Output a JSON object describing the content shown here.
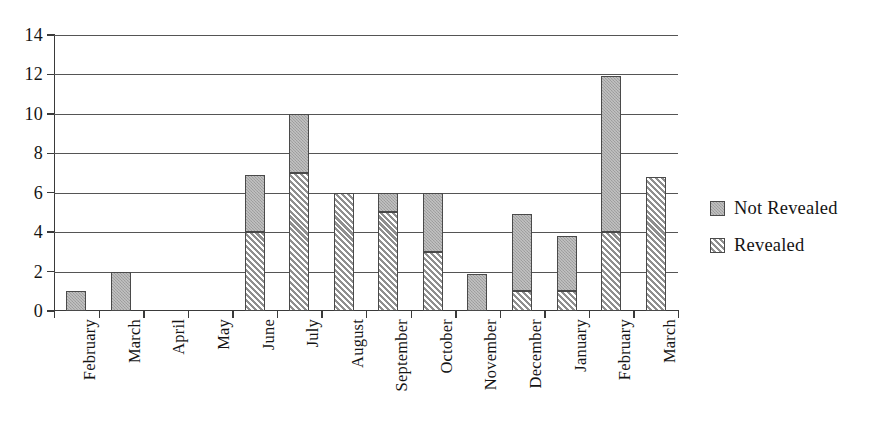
{
  "chart_data": {
    "type": "bar",
    "title": "",
    "subtitle": "",
    "xlabel": "",
    "ylabel": "",
    "stacked": true,
    "grid": true,
    "legend_position": "right",
    "ylim": [
      0,
      14
    ],
    "yticks": [
      0,
      2,
      4,
      6,
      8,
      10,
      12,
      14
    ],
    "ytick_labels": [
      "0",
      "2",
      "4",
      "6",
      "8",
      "10",
      "12",
      "14"
    ],
    "categories": [
      "February",
      "March",
      "April",
      "May",
      "June",
      "July",
      "August",
      "September",
      "October",
      "November",
      "December",
      "January",
      "February",
      "March"
    ],
    "series": [
      {
        "name": "Revealed",
        "fill": "diagonal-hatch",
        "values": [
          0,
          0,
          0,
          0,
          4,
          7,
          6,
          5,
          3,
          0,
          1,
          1,
          4,
          6.8
        ]
      },
      {
        "name": "Not Revealed",
        "fill": "solid-gray",
        "values": [
          1,
          2,
          0,
          0,
          2.9,
          3,
          0,
          1,
          3,
          1.9,
          3.9,
          2.8,
          7.9,
          0
        ]
      }
    ],
    "totals": [
      1,
      2,
      0,
      0,
      6.9,
      10,
      6,
      6,
      6,
      1.9,
      4.9,
      3.8,
      11.9,
      6.8
    ]
  },
  "legend": {
    "items": [
      {
        "label": "Not Revealed",
        "swatch": "solid-gray-swatch"
      },
      {
        "label": "Revealed",
        "swatch": "diagonal-hatch-swatch"
      }
    ]
  },
  "colors": {
    "solid_gray": "#a6a6a6",
    "hatch_light": "#d8d8d8",
    "hatch_line": "#8f8f8f",
    "axis": "#3a3a3a",
    "grid": "#555555",
    "text": "#141414",
    "background": "#ffffff"
  }
}
